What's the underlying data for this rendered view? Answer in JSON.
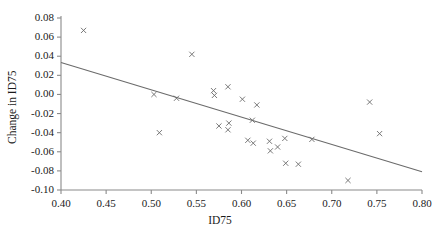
{
  "chart_data": {
    "type": "scatter",
    "title": "",
    "xlabel": "ID75",
    "ylabel": "Change in ID75",
    "xlim": [
      0.4,
      0.8
    ],
    "ylim": [
      -0.1,
      0.08
    ],
    "xticks": [
      "0.40",
      "0.45",
      "0.50",
      "0.55",
      "0.60",
      "0.65",
      "0.70",
      "0.75",
      "0.80"
    ],
    "xtick_values": [
      0.4,
      0.45,
      0.5,
      0.55,
      0.6,
      0.65,
      0.7,
      0.75,
      0.8
    ],
    "yticks": [
      "0.08",
      "0.06",
      "0.04",
      "0.02",
      "0.00",
      "-0.02",
      "-0.04",
      "-0.06",
      "-0.08",
      "-0.10"
    ],
    "ytick_values": [
      0.08,
      0.06,
      0.04,
      0.02,
      0.0,
      -0.02,
      -0.04,
      -0.06,
      -0.08,
      -0.1
    ],
    "grid": false,
    "legend": false,
    "marker": "x",
    "marker_color": "#6b6b6b",
    "axis_color": "#8a8a8a",
    "trendline_color": "#6b6b6b",
    "series": [
      {
        "name": "Change in ID75 vs ID75",
        "points": [
          {
            "x": 0.425,
            "y": 0.067
          },
          {
            "x": 0.545,
            "y": 0.042
          },
          {
            "x": 0.503,
            "y": 0.0
          },
          {
            "x": 0.528,
            "y": -0.004
          },
          {
            "x": 0.569,
            "y": 0.004
          },
          {
            "x": 0.57,
            "y": -0.001
          },
          {
            "x": 0.585,
            "y": 0.008
          },
          {
            "x": 0.601,
            "y": -0.005
          },
          {
            "x": 0.617,
            "y": -0.011
          },
          {
            "x": 0.509,
            "y": -0.04
          },
          {
            "x": 0.575,
            "y": -0.033
          },
          {
            "x": 0.586,
            "y": -0.03
          },
          {
            "x": 0.585,
            "y": -0.037
          },
          {
            "x": 0.612,
            "y": -0.027
          },
          {
            "x": 0.607,
            "y": -0.048
          },
          {
            "x": 0.613,
            "y": -0.051
          },
          {
            "x": 0.631,
            "y": -0.049
          },
          {
            "x": 0.64,
            "y": -0.055
          },
          {
            "x": 0.632,
            "y": -0.059
          },
          {
            "x": 0.648,
            "y": -0.046
          },
          {
            "x": 0.649,
            "y": -0.072
          },
          {
            "x": 0.663,
            "y": -0.073
          },
          {
            "x": 0.678,
            "y": -0.047
          },
          {
            "x": 0.718,
            "y": -0.09
          },
          {
            "x": 0.742,
            "y": -0.008
          },
          {
            "x": 0.753,
            "y": -0.041
          }
        ]
      }
    ],
    "trendline": {
      "x0": 0.4,
      "y0": 0.0335,
      "x1": 0.8,
      "y1": -0.081
    }
  }
}
